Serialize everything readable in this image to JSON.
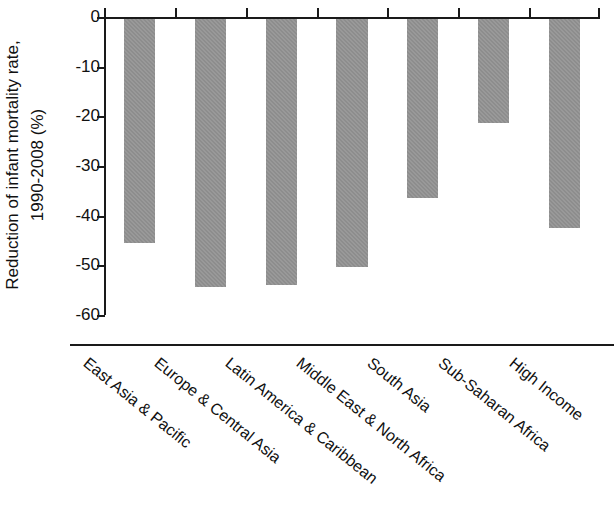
{
  "chart_data": {
    "type": "bar",
    "title": "",
    "xlabel": "",
    "ylabel": "Reduction of infant mortality rate, 1990-2008 (%)",
    "ylabel_line1": "Reduction of infant mortality rate,",
    "ylabel_line2": "1990-2008 (%)",
    "ylim": [
      -60,
      0
    ],
    "yticks": [
      0,
      -10,
      -20,
      -30,
      -40,
      -50,
      -60
    ],
    "ytick_labels": [
      "0",
      "-10",
      "-20",
      "-30",
      "-40",
      "-50",
      "-60"
    ],
    "grid": false,
    "legend": false,
    "bar_color": "#8d8d8d",
    "axis_color": "#1a1a1a",
    "categories": [
      "East Asia & Pacific",
      "Europe & Central Asia",
      "Latin America & Caribbean",
      "Middle East & North Africa",
      "South Asia",
      "Sub-Saharan Africa",
      "High Income"
    ],
    "values": [
      -45,
      -54,
      -53.5,
      -50,
      -36,
      -21,
      -42
    ]
  }
}
